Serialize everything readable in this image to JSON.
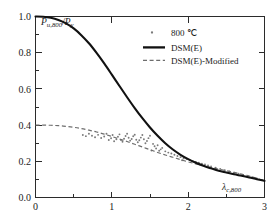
{
  "chart_data": {
    "type": "scatter",
    "title": "",
    "xlabel": "λ c,800",
    "ylabel": "P u,800 / P y",
    "xlim": [
      0,
      3
    ],
    "ylim": [
      0,
      1.0
    ],
    "xticks": [
      "0",
      "1",
      "2",
      "3"
    ],
    "yticks": [
      "0.0",
      "0.2",
      "0.4",
      "0.6",
      "0.8",
      "1.0"
    ],
    "xtick_values": [
      0,
      1,
      2,
      3
    ],
    "ytick_values": [
      0.0,
      0.2,
      0.4,
      0.6,
      0.8,
      1.0
    ],
    "minor_xticks": [
      0.5,
      1.5,
      2.5
    ],
    "minor_yticks": [
      0.1,
      0.3,
      0.5,
      0.7,
      0.9
    ],
    "grid": false,
    "legend_position": "top-right",
    "legend": [
      {
        "label": "800 ℃",
        "marker": "dot",
        "color": "#7a7a7a"
      },
      {
        "label": "DSM(E)",
        "marker": "solid-line",
        "color": "#111111"
      },
      {
        "label": "DSM(E)-Modified",
        "marker": "dashed-line",
        "color": "#6d6d6d"
      }
    ],
    "series": [
      {
        "name": "DSM(E)",
        "type": "line",
        "style": "solid",
        "color": "#111111",
        "x": [
          0.0,
          0.1,
          0.2,
          0.3,
          0.4,
          0.5,
          0.6,
          0.7,
          0.8,
          0.9,
          1.0,
          1.1,
          1.2,
          1.3,
          1.4,
          1.5,
          1.6,
          1.7,
          1.8,
          1.9,
          2.0,
          2.1,
          2.2,
          2.3,
          2.4,
          2.5,
          2.6,
          2.7,
          2.8,
          2.9,
          3.0
        ],
        "y": [
          1.0,
          0.999,
          0.993,
          0.981,
          0.962,
          0.934,
          0.897,
          0.852,
          0.799,
          0.741,
          0.679,
          0.616,
          0.554,
          0.494,
          0.438,
          0.387,
          0.341,
          0.3,
          0.265,
          0.236,
          0.212,
          0.192,
          0.175,
          0.161,
          0.148,
          0.138,
          0.128,
          0.12,
          0.111,
          0.101,
          0.092
        ]
      },
      {
        "name": "DSM(E)-Modified",
        "type": "line",
        "style": "dashed",
        "color": "#6d6d6d",
        "x": [
          0.0,
          0.1,
          0.2,
          0.3,
          0.4,
          0.5,
          0.6,
          0.7,
          0.8,
          0.9,
          1.0,
          1.1,
          1.2,
          1.3,
          1.4,
          1.5,
          1.6,
          1.7,
          1.8,
          1.9,
          2.0,
          2.1,
          2.2,
          2.3,
          2.4,
          2.5,
          2.6,
          2.7,
          2.8,
          2.9,
          3.0
        ],
        "y": [
          0.4,
          0.4,
          0.399,
          0.397,
          0.393,
          0.388,
          0.381,
          0.372,
          0.362,
          0.35,
          0.337,
          0.323,
          0.309,
          0.294,
          0.279,
          0.264,
          0.249,
          0.235,
          0.222,
          0.209,
          0.197,
          0.186,
          0.176,
          0.166,
          0.157,
          0.148,
          0.139,
          0.129,
          0.119,
          0.106,
          0.092
        ]
      },
      {
        "name": "800 ℃",
        "type": "scatter",
        "color": "#7a7a7a",
        "points": [
          [
            0.62,
            0.345
          ],
          [
            0.66,
            0.339
          ],
          [
            0.7,
            0.352
          ],
          [
            0.74,
            0.341
          ],
          [
            0.78,
            0.333
          ],
          [
            0.82,
            0.346
          ],
          [
            0.86,
            0.329
          ],
          [
            0.9,
            0.337
          ],
          [
            0.93,
            0.352
          ],
          [
            0.96,
            0.318
          ],
          [
            0.99,
            0.327
          ],
          [
            1.01,
            0.345
          ],
          [
            1.03,
            0.311
          ],
          [
            1.06,
            0.322
          ],
          [
            1.08,
            0.336
          ],
          [
            1.1,
            0.349
          ],
          [
            1.12,
            0.318
          ],
          [
            1.14,
            0.308
          ],
          [
            1.16,
            0.325
          ],
          [
            1.18,
            0.34
          ],
          [
            1.2,
            0.352
          ],
          [
            1.22,
            0.33
          ],
          [
            1.24,
            0.314
          ],
          [
            1.26,
            0.323
          ],
          [
            1.28,
            0.338
          ],
          [
            1.3,
            0.347
          ],
          [
            1.32,
            0.319
          ],
          [
            1.34,
            0.305
          ],
          [
            1.36,
            0.316
          ],
          [
            1.38,
            0.331
          ],
          [
            1.4,
            0.345
          ],
          [
            1.42,
            0.322
          ],
          [
            1.44,
            0.3
          ],
          [
            1.46,
            0.312
          ],
          [
            1.48,
            0.328
          ],
          [
            1.5,
            0.341
          ],
          [
            1.52,
            0.26
          ],
          [
            1.54,
            0.296
          ],
          [
            1.56,
            0.283
          ],
          [
            1.58,
            0.271
          ],
          [
            1.6,
            0.289
          ],
          [
            1.62,
            0.258
          ],
          [
            1.64,
            0.266
          ],
          [
            1.66,
            0.274
          ],
          [
            1.7,
            0.255
          ],
          [
            1.74,
            0.248
          ],
          [
            1.78,
            0.243
          ],
          [
            1.82,
            0.236
          ],
          [
            1.86,
            0.229
          ],
          [
            1.9,
            0.223
          ],
          [
            1.92,
            0.206
          ],
          [
            1.94,
            0.216
          ],
          [
            1.98,
            0.213
          ],
          [
            2.02,
            0.207
          ],
          [
            2.06,
            0.201
          ],
          [
            2.1,
            0.197
          ],
          [
            2.14,
            0.192
          ],
          [
            2.18,
            0.187
          ],
          [
            2.22,
            0.182
          ],
          [
            2.26,
            0.177
          ],
          [
            2.3,
            0.172
          ],
          [
            2.36,
            0.165
          ],
          [
            2.42,
            0.158
          ],
          [
            2.48,
            0.151
          ],
          [
            2.54,
            0.144
          ],
          [
            2.6,
            0.137
          ],
          [
            2.66,
            0.131
          ],
          [
            2.72,
            0.125
          ],
          [
            2.78,
            0.118
          ],
          [
            2.84,
            0.112
          ],
          [
            2.9,
            0.105
          ],
          [
            2.96,
            0.097
          ]
        ]
      }
    ]
  },
  "ylabel_parts": {
    "p1": "P",
    "sub1": "u,800",
    "slash": "/",
    "p2": "P",
    "sub2": "y"
  },
  "xlabel_parts": {
    "lambda": "λ",
    "sub": "c,800"
  }
}
